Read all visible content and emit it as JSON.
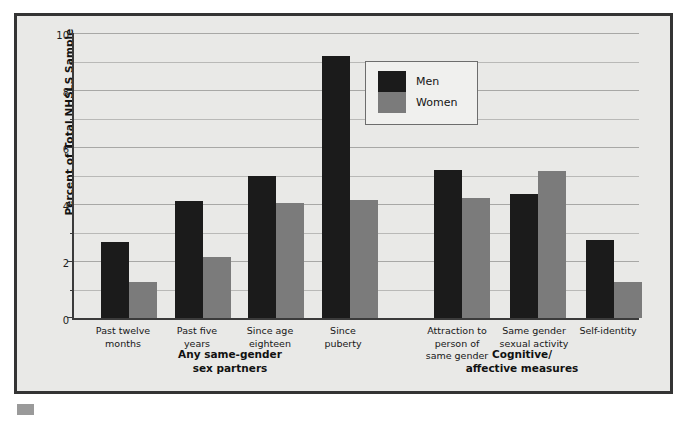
{
  "chart_data": {
    "type": "bar",
    "title": "",
    "xlabel": "",
    "ylabel": "Percent of Total NHSLS Sample",
    "ylim": [
      0,
      10
    ],
    "yticks": [
      0,
      2,
      4,
      6,
      8,
      10
    ],
    "ytick_labels": [
      "0",
      "2",
      "4",
      "6",
      "8",
      "10"
    ],
    "minor_gridlines": [
      1,
      3,
      5,
      7,
      9
    ],
    "grid": true,
    "legend_position": "upper center",
    "categories": [
      "Past twelve months",
      "Past five years",
      "Since age eighteen",
      "Since puberty",
      "Attraction to person of same gender",
      "Same gender sexual activity",
      "Self-identity"
    ],
    "series": [
      {
        "name": "Men",
        "color": "#1b1b1b",
        "values": [
          2.65,
          4.1,
          5.0,
          9.2,
          5.2,
          4.35,
          2.75
        ]
      },
      {
        "name": "Women",
        "color": "#7b7b7b",
        "values": [
          1.25,
          2.15,
          4.05,
          4.15,
          4.2,
          5.15,
          1.25
        ]
      }
    ],
    "groups": [
      {
        "label": "Any same-gender sex partners",
        "categories": [
          0,
          1,
          2,
          3
        ]
      },
      {
        "label": "Cognitive/ affective measures",
        "categories": [
          4,
          5,
          6
        ]
      }
    ]
  },
  "axis": {
    "y_title": "Percent of Total NHSLS Sample",
    "tick_labels": [
      "10",
      "8",
      "6",
      "4",
      "2",
      "0"
    ]
  },
  "legend": {
    "items": [
      {
        "label": "Men",
        "color": "#1b1b1b"
      },
      {
        "label": "Women",
        "color": "#7b7b7b"
      }
    ]
  },
  "category_labels": [
    {
      "line1": "Past twelve",
      "line2": "months",
      "line3": ""
    },
    {
      "line1": "Past five",
      "line2": "years",
      "line3": ""
    },
    {
      "line1": "Since age",
      "line2": "eighteen",
      "line3": ""
    },
    {
      "line1": "Since",
      "line2": "puberty",
      "line3": ""
    },
    {
      "line1": "Attraction to",
      "line2": "person of",
      "line3": "same gender"
    },
    {
      "line1": "Same gender",
      "line2": "sexual activity",
      "line3": ""
    },
    {
      "line1": "Self-identity",
      "line2": "",
      "line3": ""
    }
  ],
  "group_labels": [
    {
      "line1": "Any same-gender",
      "line2": "sex partners"
    },
    {
      "line1": "Cognitive/",
      "line2": "affective measures"
    }
  ],
  "colors": {
    "men": "#1b1b1b",
    "women": "#7b7b7b",
    "plot_background": "#e9e9e7",
    "frame_border": "#343434",
    "gridline": "#a8a8a6"
  }
}
